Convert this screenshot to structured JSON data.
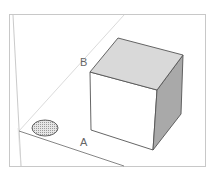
{
  "diagram": {
    "type": "3d-scene-sketch",
    "labels": {
      "axis_a": "A",
      "axis_b": "B"
    },
    "objects": [
      {
        "name": "cube",
        "kind": "box"
      },
      {
        "name": "circle-face",
        "kind": "ellipse",
        "fill_pattern": "dotted"
      }
    ],
    "colors": {
      "frame": "#c8c8c8",
      "guide_line": "#cfcfcf",
      "edge": "#555555",
      "cube_top": "#d9d9d9",
      "cube_right": "#a9a9a9",
      "cube_front": "#ffffff",
      "ellipse_fill": "#c4c4c4"
    }
  }
}
